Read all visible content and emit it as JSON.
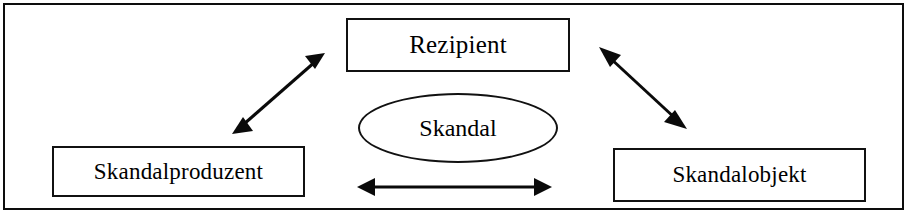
{
  "diagram": {
    "title_text": "",
    "frame": {
      "border_color": "#0d0d0d",
      "background_color": "#ffffff"
    },
    "nodes": [
      {
        "id": "rezipient",
        "label": "Rezipient",
        "shape": "rectangle",
        "position": "top-center"
      },
      {
        "id": "skandalproduzent",
        "label": "Skandalproduzent",
        "shape": "rectangle",
        "position": "bottom-left"
      },
      {
        "id": "skandalobjekt",
        "label": "Skandalobjekt",
        "shape": "rectangle",
        "position": "bottom-right"
      },
      {
        "id": "skandal",
        "label": "Skandal",
        "shape": "ellipse",
        "position": "center"
      }
    ],
    "connectors": [
      {
        "id": "skandalproduzent-rezipient",
        "from": "skandalproduzent",
        "to": "rezipient",
        "style": "double-arrow",
        "orientation": "diagonal-up-right"
      },
      {
        "id": "rezipient-skandalobjekt",
        "from": "rezipient",
        "to": "skandalobjekt",
        "style": "double-arrow",
        "orientation": "diagonal-down-right"
      },
      {
        "id": "skandalproduzent-skandalobjekt",
        "from": "skandalproduzent",
        "to": "skandalobjekt",
        "style": "double-arrow",
        "orientation": "horizontal"
      }
    ],
    "colors": {
      "stroke": "#0a0a0a",
      "text": "#000000",
      "fill": "#ffffff"
    }
  }
}
